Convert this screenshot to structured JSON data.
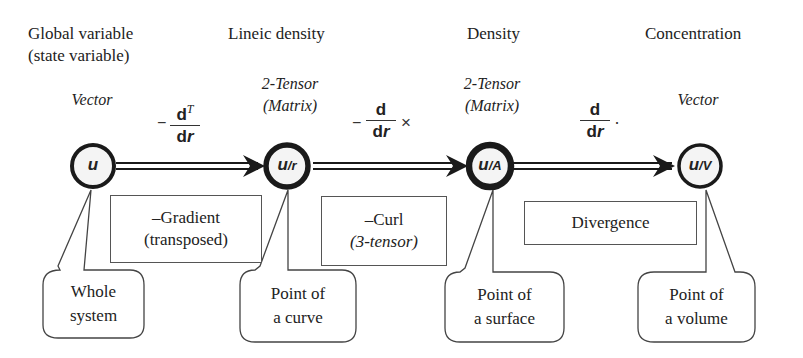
{
  "headers": {
    "col1_line1": "Global variable",
    "col1_line2": "(state variable)",
    "col2": "Lineic density",
    "col3": "Density",
    "col4": "Concentration"
  },
  "types": {
    "col1": "Vector",
    "col2_line1": "2-Tensor",
    "col2_line2": "(Matrix)",
    "col3_line1": "2-Tensor",
    "col3_line2": "(Matrix)",
    "col4": "Vector"
  },
  "operators": [
    {
      "sign": "−",
      "numerator": "d",
      "superscript": "T",
      "denominator_d": "d",
      "denominator_r": "r",
      "suffix": ""
    },
    {
      "sign": "−",
      "numerator": "d",
      "superscript": "",
      "denominator_d": "d",
      "denominator_r": "r",
      "suffix": "×"
    },
    {
      "sign": "",
      "numerator": "d",
      "superscript": "",
      "denominator_d": "d",
      "denominator_r": "r",
      "suffix": "·"
    }
  ],
  "nodes": [
    {
      "base": "u",
      "subscript": ""
    },
    {
      "base": "u",
      "subscript": "/r"
    },
    {
      "base": "u",
      "subscript": "/A"
    },
    {
      "base": "u",
      "subscript": "/V"
    }
  ],
  "operation_boxes": [
    {
      "line1": "–Gradient",
      "line2": "(transposed)"
    },
    {
      "line1": "–Curl",
      "line2": "(3-tensor)"
    },
    {
      "line1": "Divergence"
    }
  ],
  "callouts": [
    {
      "line1": "Whole",
      "line2": "system"
    },
    {
      "line1": "Point of",
      "line2": "a curve"
    },
    {
      "line1": "Point of",
      "line2": "a surface"
    },
    {
      "line1": "Point of",
      "line2": "a volume"
    }
  ],
  "colors": {
    "stroke": "#1a1a1a",
    "box_border": "#555555",
    "node_fill": "#f4f4f4"
  }
}
